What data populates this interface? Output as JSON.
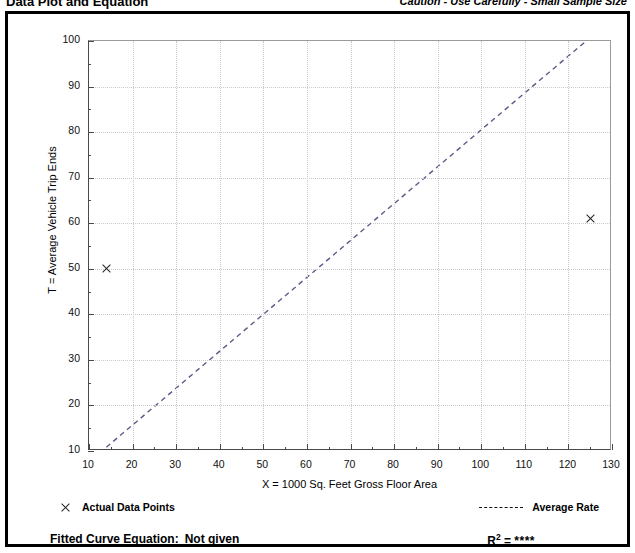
{
  "header": {
    "title": "Data Plot and Equation",
    "caution": "Caution - Use Carefully - Small Sample Size"
  },
  "legend": {
    "points_label": "Actual Data Points",
    "points_marker": "x-marker-icon",
    "rate_label": "Average Rate",
    "rate_marker": "dashed-line-icon"
  },
  "equation": {
    "fitted_label": "Fitted Curve Equation:",
    "fitted_value": "Not given",
    "r_label": "R",
    "r_exponent": "2",
    "r_equals": "=",
    "r_value": "****"
  },
  "colors": {
    "axis": "#4a4a4a",
    "grid": "#c9c9c9",
    "marker": "#222222",
    "trend": "#5b5b8a",
    "frame": "#000000"
  },
  "chart_data": {
    "type": "scatter",
    "title": "Data Plot and Equation",
    "xlabel": "X = 1000 Sq. Feet Gross Floor Area",
    "ylabel": "T = Average Vehicle Trip Ends",
    "xlim": [
      10,
      130
    ],
    "ylim": [
      10,
      100
    ],
    "xticks": [
      10,
      20,
      30,
      40,
      50,
      60,
      70,
      80,
      90,
      100,
      110,
      120,
      130
    ],
    "yticks": [
      10,
      20,
      30,
      40,
      50,
      60,
      70,
      80,
      90,
      100
    ],
    "x_minor_step": 5,
    "y_minor_step": 5,
    "grid": true,
    "grid_style": "dotted",
    "legend_position": "below-plot",
    "series": [
      {
        "name": "Actual Data Points",
        "type": "scatter",
        "marker": "x",
        "points": [
          {
            "x": 14,
            "y": 50
          },
          {
            "x": 125,
            "y": 61
          }
        ]
      },
      {
        "name": "Average Rate",
        "type": "line",
        "style": "dashed",
        "points": [
          {
            "x": 14,
            "y": 10.4
          },
          {
            "x": 124.5,
            "y": 100
          }
        ]
      }
    ],
    "annotations": [
      "Caution - Use Carefully - Small Sample Size",
      "Fitted Curve Equation: Not given",
      "R2 = ****"
    ]
  }
}
